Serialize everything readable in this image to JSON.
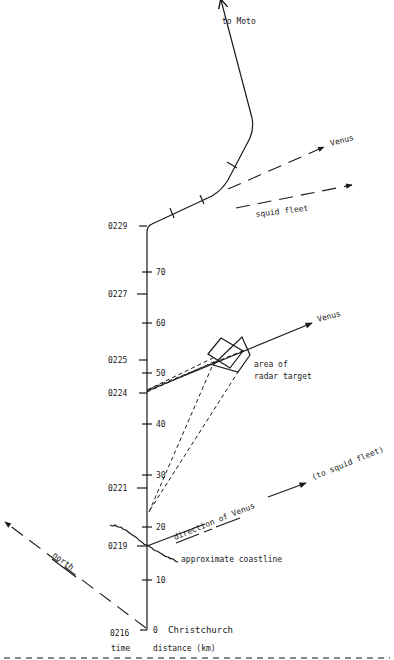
{
  "diagram": {
    "labels": {
      "to_moto": "to Moto",
      "venus_upper": "Venus",
      "squid_fleet": "squid fleet",
      "venus_middle": "Venus",
      "area_of": "area of",
      "radar_target": "radar target",
      "direction_of_venus": "direction of Venus",
      "to_squid_fleet": "(to squid fleet)",
      "north": "north",
      "approximate_coastline": "approximate coastline",
      "christchurch": "Christchurch",
      "axis_time": "time",
      "axis_distance": "distance (km)"
    },
    "time_ticks": [
      {
        "label": "0229",
        "y": 226
      },
      {
        "label": "0227",
        "y": 294
      },
      {
        "label": "0225",
        "y": 360
      },
      {
        "label": "0224",
        "y": 393
      },
      {
        "label": "0221",
        "y": 488
      },
      {
        "label": "0219",
        "y": 546
      },
      {
        "label": "0216",
        "y": 630
      }
    ],
    "distance_ticks": [
      {
        "label": "70",
        "y": 272
      },
      {
        "label": "60",
        "y": 323
      },
      {
        "label": "50",
        "y": 373
      },
      {
        "label": "40",
        "y": 424
      },
      {
        "label": "30",
        "y": 475
      },
      {
        "label": "20",
        "y": 527
      },
      {
        "label": "10",
        "y": 580
      },
      {
        "label": "0",
        "y": 630
      }
    ],
    "caption_partial": "Fig. — map of the flight path (caption cut off)"
  }
}
